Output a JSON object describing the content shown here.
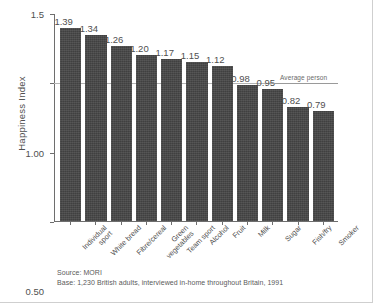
{
  "chart_data": {
    "type": "bar",
    "title": "",
    "xlabel": "",
    "ylabel": "Happiness Index",
    "ylim": [
      0.0,
      1.5
    ],
    "yticks": [
      "0.00",
      "0.50",
      "1.00",
      "1.5"
    ],
    "ytick_values": [
      0.0,
      0.5,
      1.0,
      1.5
    ],
    "grid": "horizontal gridline at 1.00 only",
    "legend": "none",
    "categories": [
      "Individual sport",
      "White bread",
      "Fibre/cereal",
      "Green vegetables",
      "Team sport",
      "Alcohol",
      "Fruit",
      "Milk",
      "Sugar",
      "Fish/fry",
      "Smoker"
    ],
    "category_lines": [
      [
        "Individual",
        "sport"
      ],
      [
        "White bread"
      ],
      [
        "Fibre/cereal"
      ],
      [
        "Green",
        "vegetables"
      ],
      [
        "Team sport"
      ],
      [
        "Alcohol"
      ],
      [
        "Fruit"
      ],
      [
        "Milk"
      ],
      [
        "Sugar"
      ],
      [
        "Fish/fry"
      ],
      [
        "Smoker"
      ]
    ],
    "values": [
      1.39,
      1.34,
      1.26,
      1.2,
      1.17,
      1.15,
      1.12,
      0.98,
      0.95,
      0.82,
      0.79
    ],
    "value_labels": [
      "1.39",
      "1.34",
      "1.26",
      "1.20",
      "1.17",
      "1.15",
      "1.12",
      "0.98",
      "0.95",
      "0.82",
      "0.79"
    ],
    "annotations": [
      {
        "name": "average-person",
        "label": "Average person",
        "y_value": 1.0
      }
    ],
    "bar_color": "#464646",
    "axis_color": "#6e6e6e",
    "gridline_color": "#b4b4b4",
    "text_color": "#4f4f4f"
  },
  "notes": {
    "source": "Source: MORI",
    "base": "Base: 1,230 British adults, interviewed in-home throughout Britain, 1991"
  }
}
